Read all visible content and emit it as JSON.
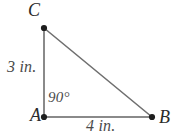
{
  "figure": {
    "type": "right-triangle",
    "background_color": "#ffffff",
    "line_color": "#8a8a8a",
    "vertex_color": "#1e1e1e",
    "text_color": "#3a3a3a",
    "vertices": [
      {
        "name": "C",
        "label": "C",
        "x": 44,
        "y": 28
      },
      {
        "name": "A",
        "label": "A",
        "x": 44,
        "y": 117
      },
      {
        "name": "B",
        "label": "B",
        "x": 152,
        "y": 117
      }
    ],
    "sides": [
      {
        "name": "leg-ac",
        "from": "A",
        "to": "C",
        "label": "3 in."
      },
      {
        "name": "leg-ab",
        "from": "A",
        "to": "B",
        "label": "4 in."
      },
      {
        "name": "hypotenuse-cb",
        "from": "C",
        "to": "B",
        "label": ""
      }
    ],
    "angles": [
      {
        "at": "A",
        "label": "90°"
      }
    ],
    "geometry": {
      "points_path": "44,28 44,117 152,117",
      "leg_vertical": {
        "x1": 44,
        "y1": 28,
        "x2": 44,
        "y2": 117
      },
      "leg_horizontal": {
        "x1": 44,
        "y1": 117,
        "x2": 152,
        "y2": 117
      },
      "hypotenuse": {
        "x1": 44,
        "y1": 28,
        "x2": 152,
        "y2": 117
      }
    }
  }
}
